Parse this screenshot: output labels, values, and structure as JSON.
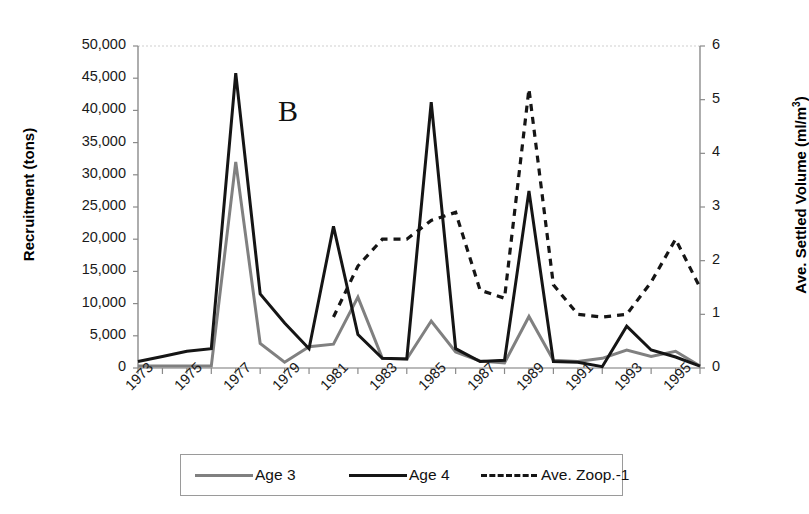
{
  "panel": {
    "label": "B"
  },
  "axes": {
    "left": {
      "title": "Recruitment (tons)",
      "ticks": [
        "50,000",
        "45,000",
        "40,000",
        "35,000",
        "30,000",
        "25,000",
        "20,000",
        "15,000",
        "10,000",
        "5,000",
        "0"
      ],
      "min": 0,
      "max": 50000
    },
    "right": {
      "title_main": "Ave. Settled Volume (ml/m",
      "title_sup": "3",
      "title_close": ")",
      "ticks": [
        "6",
        "5",
        "4",
        "3",
        "2",
        "1",
        "0"
      ],
      "min": 0,
      "max": 6
    },
    "bottom": {
      "ticks": [
        "1973",
        "1975",
        "1977",
        "1979",
        "1981",
        "1983",
        "1985",
        "1987",
        "1989",
        "1991",
        "1993",
        "1995"
      ]
    }
  },
  "legend": {
    "items": [
      {
        "label": "Age 3",
        "style": "solid",
        "color": "#808080"
      },
      {
        "label": "Age 4",
        "style": "solid",
        "color": "#151515"
      },
      {
        "label": "Ave. Zoop.-1",
        "style": "dashed",
        "color": "#151515"
      }
    ]
  },
  "chart_data": {
    "type": "line",
    "title": "B",
    "xlabel": "",
    "ylabel": "Recruitment (tons)",
    "y2label": "Ave. Settled Volume (ml/m3)",
    "xlim": [
      1973,
      1996
    ],
    "ylim": [
      0,
      50000
    ],
    "y2lim": [
      0,
      6
    ],
    "grid": false,
    "legend_position": "bottom",
    "x": [
      1973,
      1974,
      1975,
      1976,
      1977,
      1978,
      1979,
      1980,
      1981,
      1982,
      1983,
      1984,
      1985,
      1986,
      1987,
      1988,
      1989,
      1990,
      1991,
      1992,
      1993,
      1994,
      1995,
      1996
    ],
    "series": [
      {
        "name": "Age 3",
        "axis": "left",
        "style": "solid",
        "color": "#808080",
        "values": [
          300,
          300,
          300,
          300,
          32000,
          3800,
          900,
          3300,
          3700,
          11000,
          1500,
          1400,
          7300,
          2500,
          1100,
          800,
          8000,
          1200,
          1000,
          1500,
          2800,
          1800,
          2600,
          300
        ]
      },
      {
        "name": "Age 4",
        "axis": "left",
        "style": "solid",
        "color": "#151515",
        "values": [
          1000,
          1800,
          2600,
          3000,
          45800,
          11500,
          7000,
          3000,
          22000,
          5200,
          1500,
          1400,
          41300,
          3000,
          1000,
          1200,
          27500,
          1000,
          900,
          200,
          6500,
          2800,
          1700,
          300
        ]
      },
      {
        "name": "Ave. Zoop.-1",
        "axis": "right",
        "style": "dashed",
        "color": "#151515",
        "values": [
          null,
          null,
          null,
          null,
          null,
          null,
          null,
          null,
          0.95,
          1.9,
          2.4,
          2.4,
          2.75,
          2.9,
          1.45,
          1.3,
          5.2,
          1.55,
          1.0,
          0.95,
          1.0,
          1.6,
          2.4,
          1.5
        ]
      }
    ]
  }
}
